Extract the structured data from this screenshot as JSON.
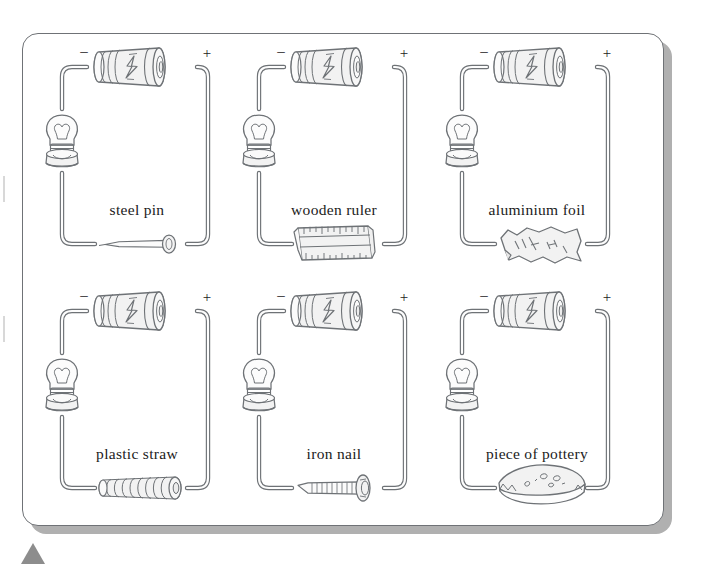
{
  "figure": {
    "kind": "science-textbook-illustration",
    "card": {
      "background_color": "#ffffff",
      "border_color": "#6f7276",
      "shadow_color": "#b0b0b0"
    },
    "line_color": "#6e7276",
    "fill_color": "#f2f2f2",
    "text_color": "#1b1b1b",
    "page_marker": {
      "shape": "triangle",
      "color": "#8d8d8d"
    }
  },
  "circuits": [
    {
      "id": "steel-pin",
      "label": "steel pin",
      "battery": {
        "negative_terminal": "–",
        "positive_terminal": "+",
        "icon": "battery-icon"
      },
      "bulb_icon": "light-bulb-icon",
      "test_item_icon": "steel-pin-icon"
    },
    {
      "id": "wooden-ruler",
      "label": "wooden ruler",
      "battery": {
        "negative_terminal": "–",
        "positive_terminal": "+",
        "icon": "battery-icon"
      },
      "bulb_icon": "light-bulb-icon",
      "test_item_icon": "wooden-ruler-icon"
    },
    {
      "id": "aluminium-foil",
      "label": "aluminium foil",
      "battery": {
        "negative_terminal": "–",
        "positive_terminal": "+",
        "icon": "battery-icon"
      },
      "bulb_icon": "light-bulb-icon",
      "test_item_icon": "aluminium-foil-icon"
    },
    {
      "id": "plastic-straw",
      "label": "plastic straw",
      "battery": {
        "negative_terminal": "–",
        "positive_terminal": "+",
        "icon": "battery-icon"
      },
      "bulb_icon": "light-bulb-icon",
      "test_item_icon": "plastic-straw-icon"
    },
    {
      "id": "iron-nail",
      "label": "iron nail",
      "battery": {
        "negative_terminal": "–",
        "positive_terminal": "+",
        "icon": "battery-icon"
      },
      "bulb_icon": "light-bulb-icon",
      "test_item_icon": "iron-nail-icon"
    },
    {
      "id": "piece-of-pottery",
      "label": "piece of pottery",
      "battery": {
        "negative_terminal": "–",
        "positive_terminal": "+",
        "icon": "battery-icon"
      },
      "bulb_icon": "light-bulb-icon",
      "test_item_icon": "pottery-shard-icon"
    }
  ]
}
